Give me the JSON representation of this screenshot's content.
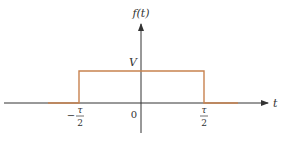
{
  "diagram": {
    "type": "rectangular pulse",
    "y_axis_label": "f(t)",
    "x_axis_label": "t",
    "amplitude_label": "V",
    "origin_label": "0",
    "left_edge": {
      "sign": "−",
      "numerator": "τ",
      "denominator": "2"
    },
    "right_edge": {
      "numerator": "τ",
      "denominator": "2"
    },
    "colors": {
      "axis": "#333333",
      "pulse": "#c8824f",
      "text": "#333333"
    }
  }
}
